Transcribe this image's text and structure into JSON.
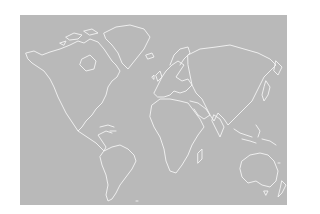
{
  "map": {
    "type": "world-outline",
    "projection": "equirectangular-like",
    "colors": {
      "ocean_land_fill": "#b9b9b9",
      "coastline": "#f4f4f4",
      "page_background": "#ffffff"
    },
    "regions": [
      "North America",
      "Greenland",
      "South America",
      "Europe",
      "Africa",
      "Asia",
      "Australia",
      "New Zealand",
      "Maritime Southeast Asia"
    ]
  }
}
